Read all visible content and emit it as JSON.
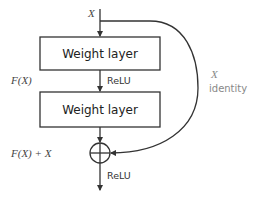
{
  "diagram": {
    "input_label": "X",
    "layers": [
      {
        "label": "Weight layer"
      },
      {
        "label": "Weight layer"
      }
    ],
    "activation_between": "ReLU",
    "activation_output": "ReLU",
    "residual_label": "F(X)",
    "sum_label": "F(X) + X",
    "shortcut": {
      "math_label": "X",
      "label": "identity"
    },
    "colors": {
      "line": "#333333",
      "text": "#222222",
      "shortcut_text": "#888888",
      "background": "#ffffff"
    }
  }
}
